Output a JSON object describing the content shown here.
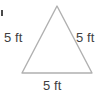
{
  "figure": {
    "type": "geometry-diagram",
    "shape": "equilateral-triangle",
    "background_color": "#ffffff",
    "stroke_color": "#b0b0b0",
    "stroke_width": 1.4,
    "text_color": "#3f3f3f",
    "vertices": {
      "apex": [
        57,
        6
      ],
      "base_left": [
        22,
        73
      ],
      "base_right": [
        92,
        73
      ]
    },
    "labels": {
      "left_side": "5 ft",
      "right_side": "5 ft",
      "base": "5 ft"
    },
    "measurement": {
      "value": 5,
      "unit": "ft",
      "unit_full": "feet",
      "side_count": 3
    },
    "artifact": {
      "name": "edge-speck",
      "color": "#4a4a4a"
    }
  }
}
